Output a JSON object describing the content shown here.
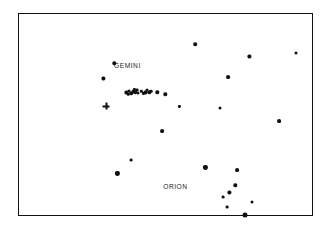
{
  "figure": {
    "background_color": "#ffffff",
    "width": 327,
    "height": 232
  },
  "frame": {
    "name": "chart-border",
    "x": 18,
    "y": 13,
    "width": 295,
    "height": 203,
    "border_color": "#111111",
    "border_width": 1.6,
    "fill_color": "#ffffff"
  },
  "labels": [
    {
      "text": "GEMINI",
      "x": 128,
      "y": 66,
      "font_size": 6.6,
      "color": "#1a1a1a"
    },
    {
      "text": "ORION",
      "x": 176,
      "y": 187,
      "font_size": 6.6,
      "color": "#1a1a1a"
    }
  ],
  "chart_data": {
    "type": "scatter",
    "xlabel": "",
    "ylabel": "",
    "xlim": [
      18,
      313
    ],
    "ylim": [
      216,
      13
    ],
    "grid": false,
    "legend": null,
    "annotations": [
      {
        "text": "GEMINI",
        "x": 128,
        "y": 66
      },
      {
        "text": "ORION",
        "x": 176,
        "y": 187
      }
    ],
    "marker_color": "#111111",
    "series": [
      {
        "name": "stars",
        "marker": "circle",
        "points": [
          {
            "x": 196,
            "y": 45,
            "size": 3.6
          },
          {
            "x": 250,
            "y": 57,
            "size": 3.2
          },
          {
            "x": 297,
            "y": 54,
            "size": 3.0
          },
          {
            "x": 229,
            "y": 78,
            "size": 3.8
          },
          {
            "x": 115,
            "y": 64,
            "size": 3.4
          },
          {
            "x": 104,
            "y": 79,
            "size": 3.2
          },
          {
            "x": 158,
            "y": 93,
            "size": 3.4
          },
          {
            "x": 180,
            "y": 107,
            "size": 2.2
          },
          {
            "x": 221,
            "y": 109,
            "size": 3.0
          },
          {
            "x": 280,
            "y": 122,
            "size": 3.8
          },
          {
            "x": 163,
            "y": 132,
            "size": 3.8
          },
          {
            "x": 132,
            "y": 161,
            "size": 2.8
          },
          {
            "x": 118,
            "y": 174,
            "size": 4.2
          },
          {
            "x": 206,
            "y": 168,
            "size": 4.2
          },
          {
            "x": 238,
            "y": 171,
            "size": 3.8
          },
          {
            "x": 230,
            "y": 193,
            "size": 3.2
          },
          {
            "x": 224,
            "y": 198,
            "size": 2.8
          },
          {
            "x": 236,
            "y": 186,
            "size": 3.4
          },
          {
            "x": 253,
            "y": 203,
            "size": 3.0
          },
          {
            "x": 228,
            "y": 208,
            "size": 2.8
          },
          {
            "x": 246,
            "y": 216,
            "size": 5.0
          },
          {
            "x": 166,
            "y": 95,
            "size": 3.4
          }
        ]
      },
      {
        "name": "central-cluster",
        "marker": "circle",
        "points": [
          {
            "x": 127,
            "y": 93,
            "size": 3.2
          },
          {
            "x": 130,
            "y": 92,
            "size": 3.0
          },
          {
            "x": 132,
            "y": 94,
            "size": 3.4
          },
          {
            "x": 134,
            "y": 92,
            "size": 2.6
          },
          {
            "x": 136,
            "y": 93,
            "size": 3.6
          },
          {
            "x": 138,
            "y": 91,
            "size": 2.8
          },
          {
            "x": 139,
            "y": 94,
            "size": 3.0
          },
          {
            "x": 142,
            "y": 92,
            "size": 2.4
          },
          {
            "x": 146,
            "y": 93,
            "size": 3.2
          },
          {
            "x": 148,
            "y": 91,
            "size": 3.0
          },
          {
            "x": 150,
            "y": 93,
            "size": 3.4
          },
          {
            "x": 152,
            "y": 92,
            "size": 2.6
          },
          {
            "x": 129,
            "y": 95,
            "size": 2.4
          },
          {
            "x": 144,
            "y": 94,
            "size": 2.2
          },
          {
            "x": 135,
            "y": 90,
            "size": 2.2
          }
        ]
      }
    ],
    "markers": [
      {
        "name": "cross-marker",
        "marker": "plus",
        "x": 107,
        "y": 107,
        "size": 7.0
      }
    ]
  }
}
